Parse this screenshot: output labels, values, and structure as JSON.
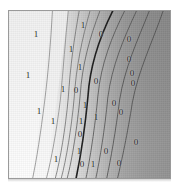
{
  "figure": {
    "kind": "contour-plot",
    "background_color": "#ffffff",
    "frame_color": "#9a9a9a"
  },
  "chart_data": {
    "type": "contour",
    "title": "",
    "subtitle": "",
    "xlabel": "",
    "ylabel": "",
    "xlim": [
      0,
      1
    ],
    "ylim": [
      0,
      1
    ],
    "grid": false,
    "legend": null,
    "colormap": {
      "description": "grayscale, light (low) on left to dark (high) on right",
      "low_color": "#ffffff",
      "mid_color": "#d9d9d9",
      "high_color": "#8f8f8f",
      "darkest_color": "#7d7d7d"
    },
    "contour_levels": [
      1,
      1,
      1,
      1,
      1,
      0,
      0,
      0,
      0,
      0
    ],
    "level_labels": [
      "1",
      "0"
    ],
    "labels": [
      {
        "text": "1",
        "x": 35,
        "y": 33,
        "tone": "dark"
      },
      {
        "text": "1",
        "x": 82,
        "y": 24,
        "tone": "dark"
      },
      {
        "text": "1",
        "x": 70,
        "y": 48,
        "tone": "dark"
      },
      {
        "text": "0",
        "x": 100,
        "y": 33,
        "tone": "dark"
      },
      {
        "text": "0",
        "x": 128,
        "y": 38,
        "tone": "dark"
      },
      {
        "text": "1",
        "x": 27,
        "y": 74,
        "tone": "dark"
      },
      {
        "text": "1",
        "x": 79,
        "y": 66,
        "tone": "dark"
      },
      {
        "text": "0",
        "x": 128,
        "y": 58,
        "tone": "dark"
      },
      {
        "text": "0",
        "x": 95,
        "y": 80,
        "tone": "dark"
      },
      {
        "text": "0",
        "x": 131,
        "y": 72,
        "tone": "dark"
      },
      {
        "text": "1",
        "x": 62,
        "y": 88,
        "tone": "dark"
      },
      {
        "text": "0",
        "x": 75,
        "y": 89,
        "tone": "dark"
      },
      {
        "text": "0",
        "x": 132,
        "y": 82,
        "tone": "dark"
      },
      {
        "text": "1",
        "x": 38,
        "y": 110,
        "tone": "dark"
      },
      {
        "text": "1",
        "x": 84,
        "y": 104,
        "tone": "dark"
      },
      {
        "text": "0",
        "x": 113,
        "y": 102,
        "tone": "dark"
      },
      {
        "text": "0",
        "x": 120,
        "y": 111,
        "tone": "dark"
      },
      {
        "text": "1",
        "x": 52,
        "y": 120,
        "tone": "dark"
      },
      {
        "text": "1",
        "x": 80,
        "y": 120,
        "tone": "dark"
      },
      {
        "text": "1",
        "x": 95,
        "y": 116,
        "tone": "dark"
      },
      {
        "text": "0",
        "x": 79,
        "y": 133,
        "tone": "dark"
      },
      {
        "text": "0",
        "x": 135,
        "y": 141,
        "tone": "dark"
      },
      {
        "text": "1",
        "x": 78,
        "y": 150,
        "tone": "dark"
      },
      {
        "text": "0",
        "x": 105,
        "y": 150,
        "tone": "dark"
      },
      {
        "text": "1",
        "x": 55,
        "y": 158,
        "tone": "dark"
      },
      {
        "text": "0",
        "x": 81,
        "y": 163,
        "tone": "dark"
      },
      {
        "text": "1",
        "x": 92,
        "y": 163,
        "tone": "dark"
      },
      {
        "text": "0",
        "x": 118,
        "y": 162,
        "tone": "dark"
      }
    ],
    "contour_paths": [
      {
        "id": "c1",
        "level": 1,
        "weight": "thin",
        "color": "#8c8c8c",
        "d": "M 44 0 C 42 34, 40 60, 36 92 C 32 124, 28 150, 24 169"
      },
      {
        "id": "c2",
        "level": 1,
        "weight": "thin",
        "color": "#8c8c8c",
        "d": "M 60 0 C 57 30, 55 58, 52 90 C 48 122, 43 150, 38 169"
      },
      {
        "id": "c3",
        "level": 1,
        "weight": "thin",
        "color": "#6f6f6f",
        "d": "M 71 0 C 66 28, 62 56, 60 88 C 57 120, 52 150, 47 169"
      },
      {
        "id": "c4",
        "level": 1,
        "weight": "thin",
        "color": "#6f6f6f",
        "d": "M 82 0 C 74 28, 68 56, 66 88 C 63 120, 58 150, 53 169"
      },
      {
        "id": "c5",
        "level": 1,
        "weight": "thin",
        "color": "#5e5e5e",
        "d": "M 92 0 C 82 26, 74 54, 72 86 C 69 118, 64 150, 59 169"
      },
      {
        "id": "c0",
        "level": 0,
        "weight": "heavy",
        "color": "#1c1c1c",
        "d": "M 105 0 C 92 26, 82 54, 80 86 C 77 118, 72 150, 68 169"
      },
      {
        "id": "c6",
        "level": 0,
        "weight": "thin",
        "color": "#4f4f4f",
        "d": "M 117 0 C 104 26, 93 54, 90 86 C 87 118, 82 150, 78 169"
      },
      {
        "id": "c7",
        "level": 0,
        "weight": "thin",
        "color": "#4f4f4f",
        "d": "M 129 0 C 116 28, 104 56, 100 88 C 97 120, 92 150, 88 169"
      },
      {
        "id": "c8",
        "level": 0,
        "weight": "thin",
        "color": "#4a4a4a",
        "d": "M 142 0 C 130 30, 117 58, 112 90 C 108 122, 103 150, 99 169"
      },
      {
        "id": "c9",
        "level": 0,
        "weight": "thin",
        "color": "#4a4a4a",
        "d": "M 156 0 C 145 32, 131 60, 125 92 C 120 124, 114 152, 110 169"
      }
    ]
  }
}
